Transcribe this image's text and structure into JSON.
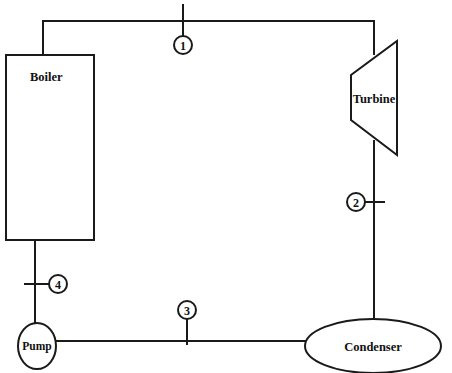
{
  "diagram": {
    "components": {
      "boiler": "Boiler",
      "turbine": "Turbine",
      "condenser": "Condenser",
      "pump": "Pump"
    },
    "states": [
      {
        "id": "1",
        "label": "1",
        "location": "boiler-to-turbine"
      },
      {
        "id": "2",
        "label": "2",
        "location": "turbine-to-condenser"
      },
      {
        "id": "3",
        "label": "3",
        "location": "condenser-to-pump"
      },
      {
        "id": "4",
        "label": "4",
        "location": "pump-to-boiler"
      }
    ],
    "colors": {
      "line": "#1a1a1a",
      "background": "#ffffff"
    }
  }
}
